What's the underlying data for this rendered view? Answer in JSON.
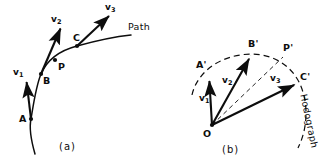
{
  "figure": {
    "panels": [
      {
        "key": "a",
        "caption": "(a)",
        "description": "Particle path with instantaneous velocity vectors at points A, B, C",
        "curve_label": "Path",
        "points": [
          {
            "name": "A",
            "label": "A",
            "x": 31,
            "y": 119
          },
          {
            "name": "B",
            "label": "B",
            "x": 41,
            "y": 74
          },
          {
            "name": "P",
            "label": "P",
            "x": 55,
            "y": 60
          },
          {
            "name": "C",
            "label": "C",
            "x": 77,
            "y": 46
          }
        ],
        "vectors": [
          {
            "name": "v1",
            "label": "v",
            "sub": "1",
            "from": [
              31,
              119
            ],
            "to": [
              26,
              79
            ]
          },
          {
            "name": "v2",
            "label": "v",
            "sub": "2",
            "from": [
              41,
              74
            ],
            "to": [
              62,
              25
            ]
          },
          {
            "name": "v3",
            "label": "v",
            "sub": "3",
            "from": [
              77,
              46
            ],
            "to": [
              111,
              13
            ]
          }
        ]
      },
      {
        "key": "b",
        "caption": "(b)",
        "description": "Hodograph: velocity vectors drawn from common origin O, tips trace the hodograph curve",
        "curve_label": "Hodograph",
        "origin": {
          "name": "O",
          "label": "O",
          "x": 212,
          "y": 125
        },
        "points": [
          {
            "name": "A-prime",
            "label": "A'",
            "x": 209,
            "y": 78
          },
          {
            "name": "B-prime",
            "label": "B'",
            "x": 251,
            "y": 55
          },
          {
            "name": "P-prime",
            "label": "P'",
            "x": 283,
            "y": 57
          },
          {
            "name": "C-prime",
            "label": "C'",
            "x": 297,
            "y": 84
          }
        ],
        "vectors": [
          {
            "name": "v1",
            "label": "v",
            "sub": "1",
            "from": [
              212,
              125
            ],
            "to": [
              209,
              78
            ]
          },
          {
            "name": "v2",
            "label": "v",
            "sub": "2",
            "from": [
              212,
              125
            ],
            "to": [
              251,
              55
            ]
          },
          {
            "name": "v3",
            "label": "v",
            "sub": "3",
            "from": [
              212,
              125
            ],
            "to": [
              297,
              84
            ]
          }
        ],
        "construction_lines": [
          {
            "name": "O-to-B-prime-chord",
            "from": [
              212,
              125
            ],
            "to": [
              251,
              55
            ]
          },
          {
            "name": "O-to-P-prime-chord",
            "from": [
              212,
              125
            ],
            "to": [
              283,
              57
            ]
          },
          {
            "name": "O-to-C-prime-chord",
            "from": [
              212,
              125
            ],
            "to": [
              297,
              84
            ]
          }
        ]
      }
    ],
    "colors": {
      "ink": "#0d0d0d",
      "background": "#ffffff"
    }
  }
}
